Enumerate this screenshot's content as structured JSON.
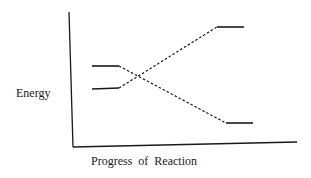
{
  "diagram": {
    "type": "energy-level-crossing",
    "y_axis_label": "Energy",
    "x_axis_label": "Progress of Reaction",
    "levels": [
      {
        "id": "reactant-upper",
        "side": "left",
        "relative_energy": "high"
      },
      {
        "id": "reactant-lower",
        "side": "left",
        "relative_energy": "low"
      },
      {
        "id": "product-upper",
        "side": "right",
        "relative_energy": "highest"
      },
      {
        "id": "product-lower",
        "side": "right",
        "relative_energy": "lowest"
      }
    ],
    "connections": [
      {
        "from": "reactant-upper",
        "to": "product-lower",
        "style": "dashed"
      },
      {
        "from": "reactant-lower",
        "to": "product-upper",
        "style": "dashed"
      }
    ],
    "colors": {
      "line": "#1a1a1a",
      "background": "#ffffff"
    }
  }
}
